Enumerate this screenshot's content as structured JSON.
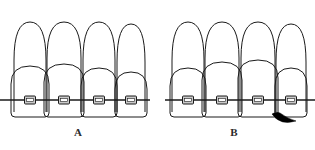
{
  "figure": {
    "background_color": "#ffffff",
    "line_color": "#1a1a1a",
    "bracket_fill": "#c9c9c9",
    "black_triangle_color": "#000000",
    "width": 315,
    "height": 150
  },
  "panels": [
    {
      "id": "A",
      "label": "A",
      "label_x": 78,
      "label_y": 131,
      "description": "Four anterior teeth with brackets on a straight archwire, closed gingival embrasures",
      "archwire": {
        "y": 100,
        "x_start": 0,
        "x_end": 150
      },
      "teeth": [
        {
          "name": "tooth-a-1",
          "root_apex_x": 30,
          "root_apex_y": 22,
          "root_half_width": 16,
          "root_base_y": 112,
          "crown_top_y": 66,
          "crown_half_width": 20,
          "crown_bottom_y": 116,
          "bracket_x": 30,
          "bracket_y": 100
        },
        {
          "name": "tooth-a-2",
          "root_apex_x": 64,
          "root_apex_y": 22,
          "root_half_width": 17,
          "root_base_y": 112,
          "crown_top_y": 64,
          "crown_half_width": 21,
          "crown_bottom_y": 116,
          "bracket_x": 64,
          "bracket_y": 100
        },
        {
          "name": "tooth-a-3",
          "root_apex_x": 99,
          "root_apex_y": 22,
          "root_half_width": 16,
          "root_base_y": 112,
          "crown_top_y": 68,
          "crown_half_width": 19,
          "crown_bottom_y": 116,
          "bracket_x": 99,
          "bracket_y": 100
        },
        {
          "name": "tooth-a-4",
          "root_apex_x": 131,
          "root_apex_y": 24,
          "root_half_width": 14,
          "root_base_y": 112,
          "crown_top_y": 72,
          "crown_half_width": 17,
          "crown_bottom_y": 116,
          "bracket_x": 131,
          "bracket_y": 100
        }
      ],
      "black_triangle": null
    },
    {
      "id": "B",
      "label": "B",
      "label_x": 234,
      "label_y": 131,
      "description": "Four anterior teeth with brackets on a straight archwire, open gingival embrasure (black triangle) between the two central teeth",
      "archwire": {
        "y": 100,
        "x_start": 165,
        "x_end": 315
      },
      "teeth": [
        {
          "name": "tooth-b-1",
          "root_apex_x": 188,
          "root_apex_y": 22,
          "root_half_width": 16,
          "root_base_y": 112,
          "crown_top_y": 68,
          "crown_half_width": 19,
          "crown_bottom_y": 116,
          "bracket_x": 188,
          "bracket_y": 100
        },
        {
          "name": "tooth-b-2",
          "root_apex_x": 222,
          "root_apex_y": 22,
          "root_half_width": 17,
          "root_base_y": 112,
          "crown_top_y": 62,
          "crown_half_width": 21,
          "crown_bottom_y": 116,
          "bracket_x": 222,
          "bracket_y": 100
        },
        {
          "name": "tooth-b-3",
          "root_apex_x": 258,
          "root_apex_y": 22,
          "root_half_width": 17,
          "root_base_y": 112,
          "crown_top_y": 60,
          "crown_half_width": 21,
          "crown_bottom_y": 116,
          "bracket_x": 258,
          "bracket_y": 100
        },
        {
          "name": "tooth-b-4",
          "root_apex_x": 291,
          "root_apex_y": 24,
          "root_half_width": 15,
          "root_base_y": 112,
          "crown_top_y": 68,
          "crown_half_width": 18,
          "crown_bottom_y": 116,
          "bracket_x": 291,
          "bracket_y": 100
        }
      ],
      "black_triangle": {
        "name": "black-triangle-open-gingival-embrasure",
        "between_teeth": [
          "tooth-b-3",
          "tooth-b-4"
        ],
        "x": 273,
        "y": 114,
        "width": 30,
        "height": 10
      }
    }
  ],
  "bracket": {
    "name": "orthodontic-bracket",
    "width": 11,
    "height": 8,
    "wing_width": 2,
    "slot_height": 3,
    "fill": "#c9c9c9",
    "stroke": "#1a1a1a"
  }
}
